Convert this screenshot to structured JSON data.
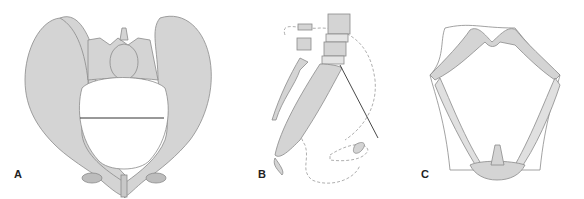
{
  "figure": {
    "panels": [
      {
        "id": "A",
        "label": "A",
        "description": "Pelvis anterior view with transverse inlet diameter line"
      },
      {
        "id": "B",
        "label": "B",
        "description": "Sagittal view of sacrum/coccyx with dashed outlines and conjugate line"
      },
      {
        "id": "C",
        "label": "C",
        "description": "Pelvic outlet view with ligaments"
      }
    ],
    "colors": {
      "bone": "#d4d4d4",
      "bone_dark": "#b9b9b9",
      "outline": "#8a8a8a",
      "line": "#333333",
      "dashed": "#9a9a9a"
    }
  }
}
